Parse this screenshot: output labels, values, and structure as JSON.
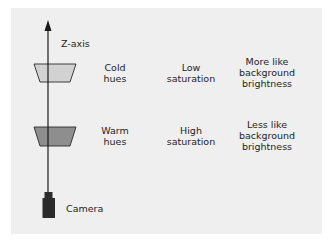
{
  "diagram": {
    "axis_label": "Z-axis",
    "camera_label": "Camera",
    "rows": [
      {
        "name": "far",
        "hue": [
          "Cold",
          "hues"
        ],
        "saturation": [
          "Low",
          "saturation"
        ],
        "brightness": [
          "More like",
          "background",
          "brightness"
        ],
        "fill": "#d2d2d2"
      },
      {
        "name": "near",
        "hue": [
          "Warm",
          "hues"
        ],
        "saturation": [
          "High",
          "saturation"
        ],
        "brightness": [
          "Less like",
          "background",
          "brightness"
        ],
        "fill": "#8e8e8e"
      }
    ],
    "colors": {
      "page_background": "#ffffff",
      "panel_background": "#efefef",
      "line": "#1a1a1a",
      "camera": "#2b2b2b"
    }
  }
}
